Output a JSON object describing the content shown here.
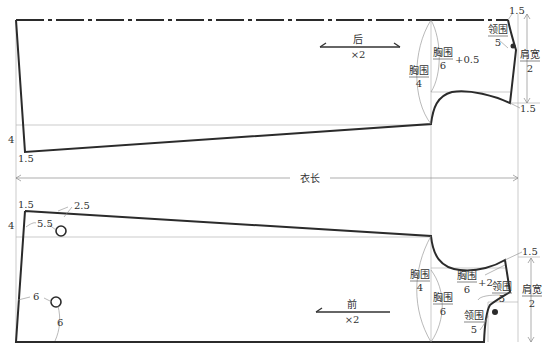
{
  "diagram": {
    "overall_length_label": "衣长",
    "back_piece": {
      "grain_label": "后",
      "grain_multiplier": "×2",
      "hem_left_offset": "1.5",
      "hem_rise": "4",
      "shoulder_top_offset": "1.5",
      "shoulder_bottom_offset": "1.5",
      "neck_label": {
        "num": "领围",
        "den": "5"
      },
      "shoulder_width_label": {
        "num": "肩宽",
        "den": "2"
      },
      "chest_quarter_label": {
        "num": "胸围",
        "den": "4"
      },
      "chest_sixth_label": {
        "num": "胸围",
        "den": "6",
        "suffix": "+0.5"
      }
    },
    "front_piece": {
      "grain_label": "前",
      "grain_multiplier": "×2",
      "hem_top_offset": "1.5",
      "hem_rise": "4",
      "button1_offset_x": "5.5",
      "button1_offset_y": "2.5",
      "button2_offset_x": "6",
      "button2_offset_y": "6",
      "shoulder_offset": "1.5",
      "shoulder_width_label": {
        "num": "肩宽",
        "den": "2"
      },
      "chest_quarter_label": {
        "num": "胸围",
        "den": "4"
      },
      "chest_sixth_label": {
        "num": "胸围",
        "den": "6"
      },
      "chest_sixth_plus_label": {
        "num": "胸围",
        "den": "6",
        "suffix": "+2"
      },
      "neck_width_label": {
        "num": "领围",
        "den": "5"
      },
      "neck_depth_label": {
        "num": "领围",
        "den": "5"
      }
    },
    "colors": {
      "outline": "#2b2b2b",
      "guide": "#b5b5b5",
      "dimension": "#8a8a8a",
      "text": "#333333",
      "background": "#ffffff"
    }
  }
}
